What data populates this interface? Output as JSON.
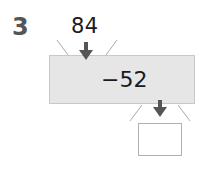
{
  "problem": {
    "number": "3",
    "input": "84",
    "operation": "−52",
    "output": "",
    "colors": {
      "machine_fill": "#e6e6e6",
      "arrow": "#555555",
      "number": "#555555"
    }
  },
  "icons": [
    "arrow-down-icon",
    "arrow-down-icon"
  ]
}
